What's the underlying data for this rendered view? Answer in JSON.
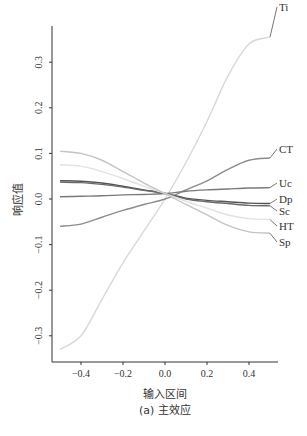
{
  "chart_data": {
    "type": "line",
    "title": "",
    "caption": "(a) 主效应",
    "xlabel": "输入区间",
    "ylabel": "响应值",
    "xlim": [
      -0.5,
      0.5
    ],
    "ylim": [
      -0.34,
      0.38
    ],
    "xticks": [
      -0.4,
      -0.2,
      0.0,
      0.2,
      0.4
    ],
    "xtick_labels": [
      "-0.4",
      "-0.2",
      "0.0",
      "0.2",
      "0.4"
    ],
    "yticks": [
      0.3,
      0.2,
      0.1,
      0.0,
      -0.1,
      -0.2,
      -0.3
    ],
    "ytick_labels": [
      "0.3",
      "0.2",
      "0.1",
      "0.0",
      "-0.1",
      "-0.2",
      "-0.3"
    ],
    "grid": false,
    "legend_position": "inline-right",
    "x": [
      -0.5,
      -0.4,
      -0.3,
      -0.2,
      -0.1,
      0.0,
      0.1,
      0.2,
      0.3,
      0.4,
      0.5
    ],
    "series": [
      {
        "name": "Ti",
        "color": "#d8d8d8",
        "values": [
          -0.33,
          -0.3,
          -0.22,
          -0.14,
          -0.07,
          0.0,
          0.08,
          0.17,
          0.27,
          0.34,
          0.355
        ]
      },
      {
        "name": "CT",
        "color": "#8c8c8c",
        "values": [
          -0.06,
          -0.055,
          -0.04,
          -0.025,
          -0.012,
          0.0,
          0.02,
          0.04,
          0.065,
          0.085,
          0.09
        ]
      },
      {
        "name": "Uc",
        "color": "#7a7a7a",
        "values": [
          0.005,
          0.006,
          0.007,
          0.009,
          0.01,
          0.012,
          0.017,
          0.02,
          0.022,
          0.024,
          0.025
        ]
      },
      {
        "name": "Dp",
        "color": "#555555",
        "values": [
          0.04,
          0.039,
          0.035,
          0.028,
          0.02,
          0.012,
          0.002,
          -0.003,
          -0.006,
          -0.009,
          -0.01
        ]
      },
      {
        "name": "Sc",
        "color": "#6a6a6a",
        "values": [
          0.037,
          0.036,
          0.032,
          0.026,
          0.019,
          0.012,
          0.0,
          -0.006,
          -0.01,
          -0.014,
          -0.015
        ]
      },
      {
        "name": "HT",
        "color": "#e2e2e2",
        "values": [
          0.075,
          0.072,
          0.06,
          0.045,
          0.028,
          0.012,
          -0.005,
          -0.02,
          -0.035,
          -0.043,
          -0.045
        ]
      },
      {
        "name": "Sp",
        "color": "#c4c4c4",
        "values": [
          0.105,
          0.1,
          0.085,
          0.06,
          0.035,
          0.012,
          -0.012,
          -0.035,
          -0.058,
          -0.072,
          -0.075
        ]
      }
    ]
  }
}
